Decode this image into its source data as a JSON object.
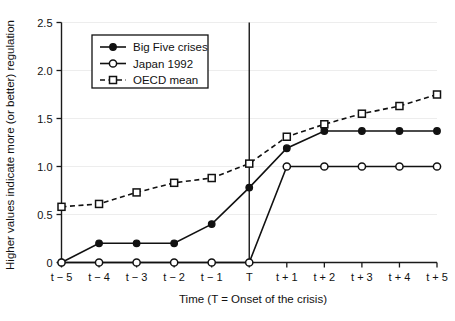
{
  "chart_data": {
    "type": "line",
    "title": "",
    "xlabel": "Time (T = Onset of the crisis)",
    "ylabel": "Higher values indicate more (or better) regulation",
    "categories": [
      "t − 5",
      "t − 4",
      "t − 3",
      "t − 2",
      "t − 1",
      "T",
      "t + 1",
      "t + 2",
      "t + 3",
      "t + 4",
      "t + 5"
    ],
    "ylim": [
      0,
      2.5
    ],
    "yticks": [
      0,
      0.5,
      1.0,
      1.5,
      2.0,
      2.5
    ],
    "ytick_labels": [
      "0",
      "0.5",
      "1.0",
      "1.5",
      "2.0",
      "2.5"
    ],
    "grid": true,
    "legend_position": "upper-left-inside",
    "annotations": [
      {
        "name": "onset-vertical-line",
        "at_category": "T",
        "label": "T"
      }
    ],
    "series": [
      {
        "name": "Big Five crises",
        "marker": "filled-circle",
        "linestyle": "solid",
        "color": "#111111",
        "values": [
          0.0,
          0.2,
          0.2,
          0.2,
          0.4,
          0.78,
          1.19,
          1.37,
          1.37,
          1.37,
          1.37
        ]
      },
      {
        "name": "Japan 1992",
        "marker": "open-circle",
        "linestyle": "solid",
        "color": "#111111",
        "values": [
          0.0,
          0.0,
          0.0,
          0.0,
          0.0,
          0.0,
          1.0,
          1.0,
          1.0,
          1.0,
          1.0
        ]
      },
      {
        "name": "OECD mean",
        "marker": "open-square",
        "linestyle": "dashed",
        "color": "#111111",
        "values": [
          0.58,
          0.61,
          0.73,
          0.83,
          0.88,
          1.03,
          1.31,
          1.44,
          1.55,
          1.63,
          1.75
        ]
      }
    ]
  },
  "legend": {
    "items": [
      {
        "label": "Big Five crises",
        "marker": "filled-circle",
        "linestyle": "solid"
      },
      {
        "label": "Japan 1992",
        "marker": "open-circle",
        "linestyle": "solid"
      },
      {
        "label": "OECD mean",
        "marker": "open-square",
        "linestyle": "dashed"
      }
    ]
  },
  "colors": {
    "ink": "#111111",
    "grid": "#ededed",
    "background": "#ffffff"
  }
}
